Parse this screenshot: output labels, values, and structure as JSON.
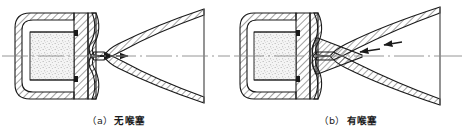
{
  "figure": {
    "background_color": "#ffffff",
    "line_color": "#1a1a1a",
    "hatch_color": "#2b2b2b",
    "propellant_fill_color": "#efefef",
    "centerline_color": "#7a7a7a",
    "width": 464,
    "height": 137
  },
  "panels": [
    {
      "id": "a",
      "caption_label": "（a）",
      "caption_text": "无喉塞",
      "caption_full": "（a）无喉塞",
      "has_throat_plug": false,
      "components": {
        "casing": "motor-casing",
        "propellant_grain": "propellant-grain",
        "nozzle": "converging-diverging-nozzle",
        "centerline": "axis-centerline",
        "flow_arrows": 2,
        "flow_arrow_direction": "right"
      }
    },
    {
      "id": "b",
      "caption_label": "（b）",
      "caption_text": "有喉塞",
      "caption_full": "（b）有喉塞",
      "has_throat_plug": true,
      "components": {
        "casing": "motor-casing",
        "propellant_grain": "propellant-grain",
        "nozzle": "converging-diverging-nozzle",
        "throat_plug": "conical-throat-plug",
        "centerline": "axis-centerline",
        "flow_arrows": 2,
        "flow_arrow_direction": "left"
      }
    }
  ]
}
